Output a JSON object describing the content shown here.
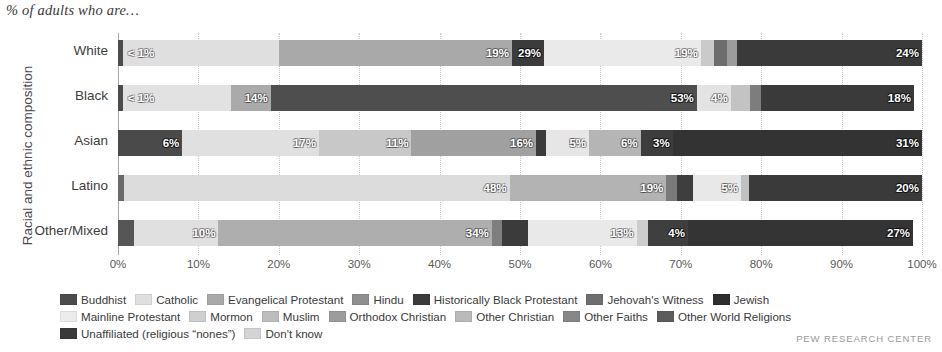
{
  "caption": "% of adults who are…",
  "yaxis_title": "Racial and ethnic composition",
  "source": "PEW RESEARCH CENTER",
  "chart_data": {
    "type": "bar",
    "orientation": "horizontal",
    "stacked": true,
    "stack_mode": "percent",
    "title": "% of adults who are…",
    "xlabel": "",
    "ylabel": "Racial and ethnic composition",
    "xlim": [
      0,
      100
    ],
    "xticks": [
      0,
      10,
      20,
      30,
      40,
      50,
      60,
      70,
      80,
      90,
      100
    ],
    "xtick_labels": [
      "0%",
      "10%",
      "20%",
      "30%",
      "40%",
      "50%",
      "60%",
      "70%",
      "80%",
      "90%",
      "100%"
    ],
    "grid": true,
    "legend_position": "bottom",
    "categories": [
      "White",
      "Black",
      "Asian",
      "Latino",
      "Other/Mixed"
    ],
    "series": [
      {
        "name": "Buddhist",
        "color": "#4c4c4c",
        "values": [
          0.5,
          0.5,
          6,
          0.4,
          2
        ]
      },
      {
        "name": "Catholic",
        "color": "#dcdcdc",
        "values": [
          19,
          5,
          17,
          48,
          10
        ]
      },
      {
        "name": "Evangelical Protestant",
        "color": "#a8a8a8",
        "values": [
          29,
          14,
          11,
          19,
          34
        ]
      },
      {
        "name": "Hindu",
        "color": "#8f8f8f",
        "values": [
          0.3,
          0.2,
          16,
          0.2,
          1
        ]
      },
      {
        "name": "Historically Black Protestant",
        "color": "#3b3b3b",
        "values": [
          1.5,
          53,
          0.6,
          1.5,
          2
        ]
      },
      {
        "name": "Jehovah's Witness",
        "color": "#6e6e6e",
        "values": [
          0.5,
          1.5,
          0.4,
          1,
          1
        ]
      },
      {
        "name": "Jewish",
        "color": "#2e2e2e",
        "values": [
          2,
          0.3,
          0.5,
          0.5,
          1
        ]
      },
      {
        "name": "Mainline Protestant",
        "color": "#ececec",
        "values": [
          19,
          4,
          5,
          5,
          13
        ]
      },
      {
        "name": "Mormon",
        "color": "#cfcfcf",
        "values": [
          1.7,
          0.4,
          0.5,
          1,
          1.5
        ]
      },
      {
        "name": "Muslim",
        "color": "#bdbdbd",
        "values": [
          0.4,
          2,
          6,
          0.4,
          1
        ]
      },
      {
        "name": "Orthodox Christian",
        "color": "#9c9c9c",
        "values": [
          0.5,
          0.3,
          0.5,
          0.4,
          0.6
        ]
      },
      {
        "name": "Other Christian",
        "color": "#bababa",
        "values": [
          0.4,
          0.3,
          0.4,
          0.4,
          0.6
        ]
      },
      {
        "name": "Other Faiths",
        "color": "#878787",
        "values": [
          1.2,
          0.5,
          3,
          1.2,
          4
        ]
      },
      {
        "name": "Other World Religions",
        "color": "#5c5c5c",
        "values": [
          0.4,
          0.3,
          0.4,
          0.4,
          0.6
        ]
      },
      {
        "name": "Unaffiliated (religious “nones”)",
        "color": "#3a3a3a",
        "values": [
          24,
          18,
          31,
          20,
          27
        ]
      },
      {
        "name": "Don't know",
        "color": "#d4d4d4",
        "values": [
          0.5,
          0.5,
          1.7,
          0.6,
          0.7
        ]
      }
    ],
    "labeled_values": {
      "White": [
        "< 1%",
        "19%",
        "29%",
        "19%",
        "24%"
      ],
      "Black": [
        "< 1%",
        "14%",
        "53%",
        "4%",
        "18%"
      ],
      "Asian": [
        "6%",
        "17%",
        "11%",
        "16%",
        "5%",
        "6%",
        "3%",
        "31%"
      ],
      "Latino": [
        "48%",
        "19%",
        "5%",
        "20%"
      ],
      "Other/Mixed": [
        "10%",
        "34%",
        "13%",
        "4%",
        "27%"
      ]
    }
  },
  "rows": [
    {
      "label": "White",
      "segments": [
        {
          "series": "Buddhist",
          "color": "#4c4c4c",
          "width": 0.6,
          "label": ""
        },
        {
          "series": "Catholic",
          "color": "#dfdfdf",
          "width": 19.4,
          "label": "< 1%",
          "label_pos": "left",
          "tone": "light"
        },
        {
          "series": "Mainline Protestant",
          "color": "#d0d0d0",
          "width": 0.0,
          "label": ""
        },
        {
          "series": "Evangelical Protestant",
          "color": "#a9a9a9",
          "width": 29.0,
          "label": "19%",
          "tone": "light"
        },
        {
          "series": "Historically Black Protestant",
          "color": "#3b3b3b",
          "width": 4.0,
          "label": "29%",
          "tone": "dark"
        },
        {
          "series": "Mainline Protestant",
          "color": "#eaeaea",
          "width": 19.5,
          "label": "19%",
          "tone": "light"
        },
        {
          "series": "Mormon",
          "color": "#cacaca",
          "width": 1.6,
          "label": ""
        },
        {
          "series": "Jehovah's Witness",
          "color": "#6d6d6d",
          "width": 1.6,
          "label": ""
        },
        {
          "series": "Jewish",
          "color": "#9b9b9b",
          "width": 1.3,
          "label": ""
        },
        {
          "series": "Unaffiliated (religious “nones”)",
          "color": "#3a3a3a",
          "width": 23.0,
          "label": "24%",
          "tone": "dark"
        }
      ]
    },
    {
      "label": "Black",
      "segments": [
        {
          "series": "Buddhist",
          "color": "#4c4c4c",
          "width": 0.6,
          "label": ""
        },
        {
          "series": "Catholic",
          "color": "#e2e2e2",
          "width": 13.4,
          "label": "< 1%",
          "label_pos": "left",
          "tone": "light"
        },
        {
          "series": "Evangelical Protestant",
          "color": "#aaaaaa",
          "width": 5.0,
          "label": "14%",
          "tone": "light"
        },
        {
          "series": "Historically Black Protestant",
          "color": "#4e4e4e",
          "width": 53.0,
          "label": "53%",
          "tone": "dark"
        },
        {
          "series": "Mainline Protestant",
          "color": "#e3e3e3",
          "width": 4.2,
          "label": "4%",
          "tone": "light"
        },
        {
          "series": "Muslim",
          "color": "#c3c3c3",
          "width": 2.4,
          "label": ""
        },
        {
          "series": "Jehovah's Witness",
          "color": "#7d7d7d",
          "width": 1.4,
          "label": ""
        },
        {
          "series": "Unaffiliated (religious “nones”)",
          "color": "#3a3a3a",
          "width": 19.0,
          "label": "18%",
          "tone": "dark"
        }
      ]
    },
    {
      "label": "Asian",
      "segments": [
        {
          "series": "Buddhist",
          "color": "#4a4a4a",
          "width": 8.0,
          "label": "6%",
          "tone": "dark"
        },
        {
          "series": "Catholic",
          "color": "#e0e0e0",
          "width": 17.0,
          "label": "17%",
          "tone": "light"
        },
        {
          "series": "Evangelical Protestant",
          "color": "#c8c8c8",
          "width": 11.5,
          "label": "11%",
          "tone": "light"
        },
        {
          "series": "Hindu",
          "color": "#a0a0a0",
          "width": 15.5,
          "label": "16%",
          "tone": "light"
        },
        {
          "series": "Historically Black Protestant",
          "color": "#3b3b3b",
          "width": 1.2,
          "label": ""
        },
        {
          "series": "Mainline Protestant",
          "color": "#e6e6e6",
          "width": 5.4,
          "label": "5%",
          "tone": "light"
        },
        {
          "series": "Muslim",
          "color": "#b5b5b5",
          "width": 6.4,
          "label": "6%",
          "tone": "light"
        },
        {
          "series": "Other Faiths",
          "color": "#3d3d3d",
          "width": 4.0,
          "label": "3%",
          "tone": "dark"
        },
        {
          "series": "Unaffiliated (religious “nones”)",
          "color": "#333333",
          "width": 31.0,
          "label": "31%",
          "tone": "dark"
        }
      ]
    },
    {
      "label": "Latino",
      "segments": [
        {
          "series": "Buddhist",
          "color": "#6a6a6a",
          "width": 0.7,
          "label": ""
        },
        {
          "series": "Catholic",
          "color": "#dcdcdc",
          "width": 48.0,
          "label": "48%",
          "tone": "light"
        },
        {
          "series": "Evangelical Protestant",
          "color": "#b3b3b3",
          "width": 19.5,
          "label": "19%",
          "tone": "light"
        },
        {
          "series": "Jehovah's Witness",
          "color": "#7a7a7a",
          "width": 1.3,
          "label": ""
        },
        {
          "series": "Historically Black Protestant",
          "color": "#3e3e3e",
          "width": 2.0,
          "label": ""
        },
        {
          "series": "Mainline Protestant",
          "color": "#e8e8e8",
          "width": 6.0,
          "label": "5%",
          "tone": "light"
        },
        {
          "series": "Mormon",
          "color": "#c0c0c0",
          "width": 1.0,
          "label": ""
        },
        {
          "series": "Unaffiliated (religious “nones”)",
          "color": "#3a3a3a",
          "width": 21.5,
          "label": "20%",
          "tone": "dark"
        }
      ]
    },
    {
      "label": "Other/Mixed",
      "segments": [
        {
          "series": "Buddhist",
          "color": "#565656",
          "width": 2.0,
          "label": ""
        },
        {
          "series": "Catholic",
          "color": "#e0e0e0",
          "width": 10.5,
          "label": "10%",
          "tone": "light"
        },
        {
          "series": "Evangelical Protestant",
          "color": "#aeaeae",
          "width": 34.0,
          "label": "34%",
          "tone": "light"
        },
        {
          "series": "Jehovah's Witness",
          "color": "#7e7e7e",
          "width": 1.3,
          "label": ""
        },
        {
          "series": "Historically Black Protestant",
          "color": "#3b3b3b",
          "width": 3.2,
          "label": ""
        },
        {
          "series": "Mainline Protestant",
          "color": "#e9e9e9",
          "width": 13.5,
          "label": "13%",
          "tone": "light"
        },
        {
          "series": "Mormon",
          "color": "#cdcdcd",
          "width": 1.4,
          "label": ""
        },
        {
          "series": "Other Faiths",
          "color": "#3f3f3f",
          "width": 5.0,
          "label": "4%",
          "tone": "dark"
        },
        {
          "series": "Unaffiliated (religious “nones”)",
          "color": "#343434",
          "width": 28.0,
          "label": "27%",
          "tone": "dark"
        }
      ]
    }
  ],
  "xticks": [
    {
      "label": "0%",
      "pos": 0
    },
    {
      "label": "10%",
      "pos": 10
    },
    {
      "label": "20%",
      "pos": 20
    },
    {
      "label": "30%",
      "pos": 30
    },
    {
      "label": "40%",
      "pos": 40
    },
    {
      "label": "50%",
      "pos": 50
    },
    {
      "label": "60%",
      "pos": 60
    },
    {
      "label": "70%",
      "pos": 70
    },
    {
      "label": "80%",
      "pos": 80
    },
    {
      "label": "90%",
      "pos": 90
    },
    {
      "label": "100%",
      "pos": 100
    }
  ],
  "legend": {
    "rows": [
      [
        {
          "label": "Buddhist",
          "color": "#4c4c4c"
        },
        {
          "label": "Catholic",
          "color": "#dfdfdf"
        },
        {
          "label": "Evangelical Protestant",
          "color": "#a9a9a9"
        },
        {
          "label": "Hindu",
          "color": "#8f8f8f"
        },
        {
          "label": "Historically Black Protestant",
          "color": "#3b3b3b"
        },
        {
          "label": "Jehovah's Witness",
          "color": "#6e6e6e"
        },
        {
          "label": "Jewish",
          "color": "#2e2e2e"
        }
      ],
      [
        {
          "label": "Mainline Protestant",
          "color": "#ececec"
        },
        {
          "label": "Mormon",
          "color": "#cfcfcf"
        },
        {
          "label": "Muslim",
          "color": "#bdbdbd"
        },
        {
          "label": "Orthodox Christian",
          "color": "#9c9c9c"
        },
        {
          "label": "Other Christian",
          "color": "#bababa"
        },
        {
          "label": "Other Faiths",
          "color": "#878787"
        },
        {
          "label": "Other World Religions",
          "color": "#5c5c5c"
        }
      ],
      [
        {
          "label": "Unaffiliated (religious “nones”)",
          "color": "#3a3a3a"
        },
        {
          "label": "Don't know",
          "color": "#d4d4d4"
        }
      ]
    ]
  }
}
